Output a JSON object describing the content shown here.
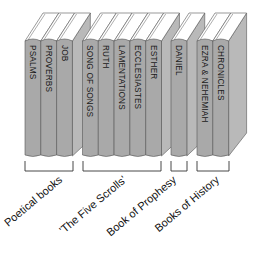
{
  "books": [
    {
      "title": "PSALMS",
      "group": 0
    },
    {
      "title": "PROVERBS",
      "group": 0
    },
    {
      "title": "JOB",
      "group": 0
    },
    {
      "title": "SONG OF SONGS",
      "group": 1
    },
    {
      "title": "RUTH",
      "group": 1
    },
    {
      "title": "LAMENTATIONS",
      "group": 1
    },
    {
      "title": "ECCLESIASTES",
      "group": 1
    },
    {
      "title": "ESTHER",
      "group": 1
    },
    {
      "title": "DANIEL",
      "group": 2
    },
    {
      "title": "EZRA & NEHEMIAH",
      "group": 3
    },
    {
      "title": "CHRONICLES",
      "group": 3
    }
  ],
  "groups": [
    {
      "label": "Poetical books"
    },
    {
      "label": "'The Five Scrolls'"
    },
    {
      "label": "Book of Prophesy"
    },
    {
      "label": "Books of History"
    }
  ],
  "colors": {
    "spine": "#a9a9a9",
    "side": "#b9b9b9",
    "top": "#ffffff",
    "outline": "#555555"
  }
}
